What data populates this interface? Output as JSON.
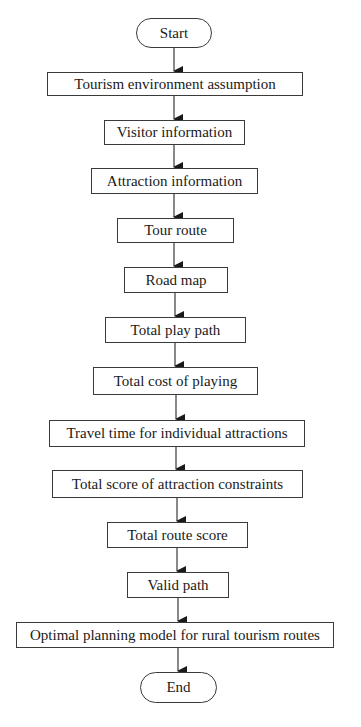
{
  "diagram": {
    "type": "flowchart",
    "direction": "top-to-bottom",
    "colors": {
      "stroke": "#3a3a3a",
      "text": "#1a1a1a",
      "background": "#ffffff"
    },
    "nodes": [
      {
        "id": "start",
        "shape": "terminator",
        "label": "Start"
      },
      {
        "id": "n1",
        "shape": "process",
        "label": "Tourism environment assumption"
      },
      {
        "id": "n2",
        "shape": "process",
        "label": "Visitor information"
      },
      {
        "id": "n3",
        "shape": "process",
        "label": "Attraction information"
      },
      {
        "id": "n4",
        "shape": "process",
        "label": "Tour route"
      },
      {
        "id": "n5",
        "shape": "process",
        "label": "Road map"
      },
      {
        "id": "n6",
        "shape": "process",
        "label": "Total play path"
      },
      {
        "id": "n7",
        "shape": "process",
        "label": "Total cost of playing"
      },
      {
        "id": "n8",
        "shape": "process",
        "label": "Travel time for individual attractions"
      },
      {
        "id": "n9",
        "shape": "process",
        "label": "Total score of attraction constraints"
      },
      {
        "id": "n10",
        "shape": "process",
        "label": "Total route score"
      },
      {
        "id": "n11",
        "shape": "process",
        "label": "Valid path"
      },
      {
        "id": "n12",
        "shape": "process",
        "label": "Optimal planning model for rural tourism routes"
      },
      {
        "id": "end",
        "shape": "terminator",
        "label": "End"
      }
    ],
    "edges": [
      [
        "start",
        "n1"
      ],
      [
        "n1",
        "n2"
      ],
      [
        "n2",
        "n3"
      ],
      [
        "n3",
        "n4"
      ],
      [
        "n4",
        "n5"
      ],
      [
        "n5",
        "n6"
      ],
      [
        "n6",
        "n7"
      ],
      [
        "n7",
        "n8"
      ],
      [
        "n8",
        "n9"
      ],
      [
        "n9",
        "n10"
      ],
      [
        "n10",
        "n11"
      ],
      [
        "n11",
        "n12"
      ],
      [
        "n12",
        "end"
      ]
    ]
  }
}
